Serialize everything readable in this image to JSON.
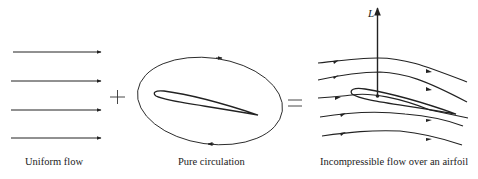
{
  "figure": {
    "panels": [
      {
        "id": "uniform",
        "caption": "Uniform flow",
        "arrow_count": 4
      },
      {
        "id": "circulation",
        "caption": "Pure circulation"
      },
      {
        "id": "combined",
        "caption": "Incompressible flow over an airfoil",
        "force_label": "L"
      }
    ],
    "operators": {
      "plus": "+",
      "equals": "="
    },
    "colors": {
      "ink": "#222222",
      "background": "#ffffff"
    }
  }
}
